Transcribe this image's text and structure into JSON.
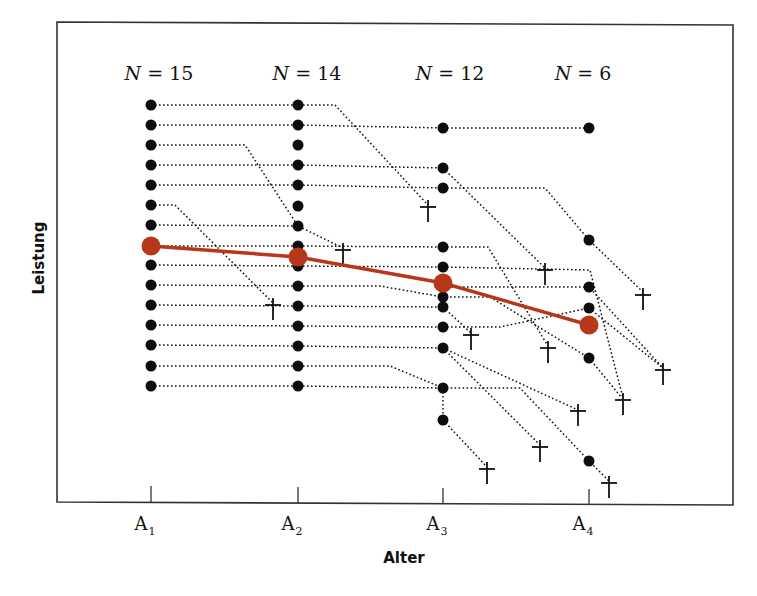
{
  "chart_data": {
    "type": "line",
    "title": "",
    "xlabel": "Alter",
    "ylabel": "Leistung",
    "categories": [
      "A1",
      "A2",
      "A3",
      "A4"
    ],
    "category_labels": [
      {
        "main": "A",
        "sub": "1"
      },
      {
        "main": "A",
        "sub": "2"
      },
      {
        "main": "A",
        "sub": "3"
      },
      {
        "main": "A",
        "sub": "4"
      }
    ],
    "sample_sizes": [
      {
        "var": "N",
        "eq": " = ",
        "value": "15"
      },
      {
        "var": "N",
        "eq": " = ",
        "value": "14"
      },
      {
        "var": "N",
        "eq": " = ",
        "value": "12"
      },
      {
        "var": "N",
        "eq": " = ",
        "value": "6"
      }
    ],
    "n_values": [
      15,
      14,
      12,
      6
    ],
    "grid": false,
    "legend": null,
    "colors": {
      "mean": "#b8361a",
      "points": "#0d0d0d",
      "frame": "#333333"
    },
    "series": [
      {
        "name": "Mittelwert (Querschnitt)",
        "type": "line",
        "color": "#b8361a",
        "values": [
          246,
          257,
          283,
          325
        ],
        "note": "pixel y-positions; lower y = higher Leistung; mean declines with age"
      }
    ],
    "mean_points_px": [
      [
        151,
        246
      ],
      [
        298,
        257
      ],
      [
        443,
        283
      ],
      [
        589,
        325
      ]
    ],
    "dropout_symbol": "†",
    "individuals": {
      "A1_px_y": [
        105,
        125,
        145,
        165,
        185,
        205,
        225,
        246,
        265,
        285,
        305,
        325,
        345,
        366,
        386
      ],
      "A2_px_y": [
        105,
        125,
        145,
        165,
        185,
        206,
        226,
        246,
        266,
        286,
        306,
        326,
        346,
        366,
        386
      ],
      "A3_px_y": [
        128,
        168,
        188,
        247,
        267,
        287,
        297,
        307,
        327,
        348,
        388,
        420
      ],
      "A4_px_y": [
        128,
        240,
        287,
        308,
        358,
        461
      ]
    },
    "trajectories": [
      {
        "points": [
          [
            151,
            105
          ],
          [
            298,
            105
          ],
          [
            335,
            105
          ],
          [
            428,
            205
          ]
        ],
        "end": "cross"
      },
      {
        "points": [
          [
            151,
            125
          ],
          [
            298,
            125
          ],
          [
            443,
            128
          ],
          [
            589,
            128
          ]
        ],
        "end": "none"
      },
      {
        "points": [
          [
            151,
            145
          ],
          [
            245,
            145
          ],
          [
            298,
            226
          ]
        ],
        "end": "none"
      },
      {
        "points": [
          [
            151,
            165
          ],
          [
            298,
            165
          ],
          [
            443,
            168
          ],
          [
            545,
            268
          ]
        ],
        "end": "cross"
      },
      {
        "points": [
          [
            151,
            185
          ],
          [
            298,
            185
          ],
          [
            443,
            188
          ],
          [
            545,
            188
          ],
          [
            589,
            240
          ],
          [
            643,
            292
          ]
        ],
        "end": "cross"
      },
      {
        "points": [
          [
            151,
            205
          ],
          [
            175,
            205
          ],
          [
            273,
            303
          ]
        ],
        "end": "cross"
      },
      {
        "points": [
          [
            151,
            225
          ],
          [
            298,
            226
          ],
          [
            343,
            248
          ]
        ],
        "end": "cross"
      },
      {
        "points": [
          [
            151,
            246
          ],
          [
            298,
            246
          ],
          [
            443,
            247
          ],
          [
            488,
            247
          ],
          [
            548,
            346
          ]
        ],
        "end": "cross"
      },
      {
        "points": [
          [
            151,
            265
          ],
          [
            298,
            266
          ],
          [
            443,
            267
          ],
          [
            590,
            270
          ],
          [
            623,
            398
          ]
        ],
        "end": "cross"
      },
      {
        "points": [
          [
            151,
            285
          ],
          [
            298,
            286
          ],
          [
            380,
            286
          ],
          [
            443,
            297
          ],
          [
            490,
            297
          ],
          [
            589,
            358
          ],
          [
            622,
            398
          ]
        ],
        "end": "none"
      },
      {
        "points": [
          [
            151,
            305
          ],
          [
            298,
            306
          ],
          [
            443,
            307
          ],
          [
            471,
            333
          ]
        ],
        "end": "cross"
      },
      {
        "points": [
          [
            151,
            325
          ],
          [
            298,
            326
          ],
          [
            443,
            327
          ],
          [
            500,
            327
          ],
          [
            589,
            308
          ],
          [
            663,
            368
          ]
        ],
        "end": "cross"
      },
      {
        "points": [
          [
            151,
            345
          ],
          [
            298,
            346
          ],
          [
            443,
            348
          ],
          [
            578,
            410
          ]
        ],
        "end": "cross"
      },
      {
        "points": [
          [
            151,
            366
          ],
          [
            298,
            366
          ],
          [
            390,
            366
          ],
          [
            443,
            388
          ],
          [
            520,
            388
          ],
          [
            589,
            461
          ],
          [
            609,
            481
          ]
        ],
        "end": "cross"
      },
      {
        "points": [
          [
            151,
            386
          ],
          [
            298,
            386
          ],
          [
            443,
            388
          ],
          [
            443,
            420
          ],
          [
            487,
            467
          ]
        ],
        "end": "cross"
      },
      {
        "points": [
          [
            443,
            287
          ],
          [
            500,
            287
          ],
          [
            589,
            287
          ],
          [
            663,
            368
          ]
        ],
        "end": "none"
      },
      {
        "points": [
          [
            443,
            348
          ],
          [
            540,
            445
          ]
        ],
        "end": "cross"
      }
    ],
    "crosses_px": [
      [
        428,
        210
      ],
      [
        343,
        253
      ],
      [
        273,
        308
      ],
      [
        545,
        273
      ],
      [
        643,
        298
      ],
      [
        548,
        351
      ],
      [
        471,
        338
      ],
      [
        663,
        373
      ],
      [
        578,
        414
      ],
      [
        623,
        403
      ],
      [
        540,
        450
      ],
      [
        609,
        486
      ],
      [
        487,
        472
      ]
    ]
  }
}
